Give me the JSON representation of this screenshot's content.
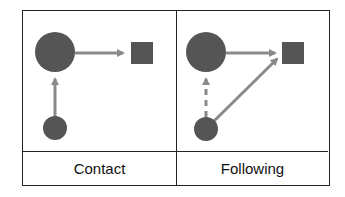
{
  "panels": [
    {
      "label": "Contact",
      "edges": [
        {
          "from": "small-node",
          "to": "large-node",
          "style": "solid"
        },
        {
          "from": "large-node",
          "to": "square-node",
          "style": "solid"
        }
      ]
    },
    {
      "label": "Following",
      "edges": [
        {
          "from": "small-node",
          "to": "large-node",
          "style": "dashed"
        },
        {
          "from": "large-node",
          "to": "square-node",
          "style": "solid"
        },
        {
          "from": "small-node",
          "to": "square-node",
          "style": "solid"
        }
      ]
    }
  ],
  "colors": {
    "node": "#555555",
    "edge": "#8a8a8a",
    "border": "#222222"
  }
}
